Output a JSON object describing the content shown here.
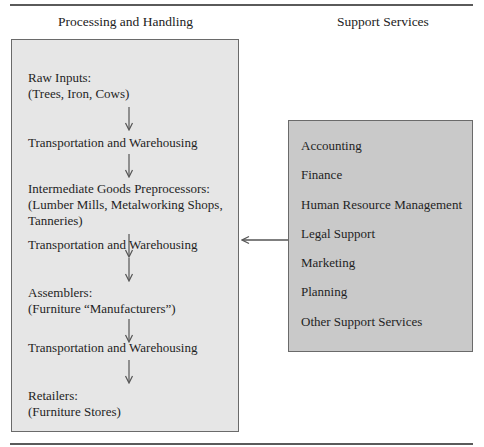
{
  "diagram": {
    "columns": {
      "left_title": "Processing and Handling",
      "right_title": "Support Services"
    },
    "processing_chain": [
      {
        "line1": "Raw Inputs:",
        "line2": "(Trees, Iron, Cows)"
      },
      {
        "line1": "Transportation and Warehousing"
      },
      {
        "line1": "Intermediate Goods Preprocessors:",
        "line2": "(Lumber Mills, Metalworking Shops,",
        "line3": "Tanneries)"
      },
      {
        "line1": "Transportation and Warehousing"
      },
      {
        "line1": "Assemblers:",
        "line2": "(Furniture “Manufacturers”)"
      },
      {
        "line1": "Transportation and Warehousing"
      },
      {
        "line1": "Retailers:",
        "line2": "(Furniture Stores)"
      }
    ],
    "support_services": [
      "Accounting",
      "Finance",
      "Human Resource Management",
      "Legal Support",
      "Marketing",
      "Planning",
      "Other Support Services"
    ],
    "connector": {
      "from": "Support Services",
      "to": "Transportation and Warehousing (2nd)",
      "direction": "left"
    },
    "colors": {
      "left_box_fill": "#e6e6e6",
      "right_box_fill": "#c9c9c9",
      "border": "#6a6a6a",
      "rule": "#5a5a5a"
    }
  }
}
